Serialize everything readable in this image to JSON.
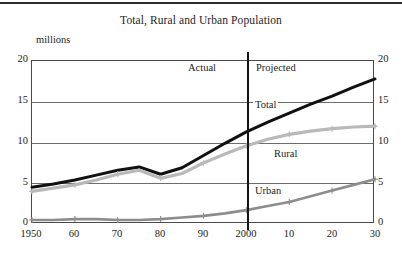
{
  "chart_data": {
    "type": "line",
    "title": "Total, Rural and Urban Population",
    "xlabel": "",
    "ylabel": "millions",
    "ylim": [
      0,
      20
    ],
    "xlim": [
      1950,
      2030
    ],
    "yticks": [
      0,
      5,
      10,
      15,
      20
    ],
    "yticks_right": [
      0,
      5,
      10,
      15,
      20
    ],
    "grid": true,
    "legend": "inline-labels",
    "x": [
      1950,
      1955,
      1960,
      1965,
      1970,
      1975,
      1980,
      1985,
      1990,
      1995,
      2000,
      2005,
      2010,
      2015,
      2020,
      2025,
      2030
    ],
    "xtick_labels": [
      "1950",
      "60",
      "70",
      "80",
      "90",
      "2000",
      "10",
      "20",
      "30"
    ],
    "xtick_values": [
      1950,
      1960,
      1970,
      1980,
      1990,
      2000,
      2010,
      2020,
      2030
    ],
    "series": [
      {
        "name": "Total",
        "color": "#111111",
        "values": [
          4.5,
          4.9,
          5.4,
          6.0,
          6.6,
          7.0,
          6.1,
          6.9,
          8.4,
          9.9,
          11.3,
          12.5,
          13.6,
          14.7,
          15.7,
          16.8,
          17.8
        ]
      },
      {
        "name": "Rural",
        "color": "#b9b9b9",
        "values": [
          4.0,
          4.4,
          4.8,
          5.4,
          6.1,
          6.6,
          5.6,
          6.2,
          7.5,
          8.6,
          9.6,
          10.4,
          11.0,
          11.4,
          11.7,
          11.9,
          12.0
        ]
      },
      {
        "name": "Urban",
        "color": "#8d8d8d",
        "values": [
          0.5,
          0.5,
          0.6,
          0.6,
          0.5,
          0.5,
          0.6,
          0.8,
          1.0,
          1.3,
          1.7,
          2.2,
          2.7,
          3.4,
          4.1,
          4.8,
          5.5
        ]
      }
    ],
    "annotations": [
      {
        "name": "actual",
        "text": "Actual",
        "x": 1985,
        "y": 18.6
      },
      {
        "name": "projected",
        "text": "Projected",
        "x": 2009,
        "y": 18.6
      },
      {
        "name": "divider",
        "text": "",
        "x": 2000,
        "y": null
      }
    ],
    "phase_divider_year": 2000
  },
  "labels": {
    "title": "Total, Rural and Urban Population",
    "unit": "millions",
    "actual": "Actual",
    "projected": "Projected",
    "total": "Total",
    "rural": "Rural",
    "urban": "Urban",
    "y_0": "0",
    "y_5": "5",
    "y_10": "10",
    "y_15": "15",
    "y_20": "20",
    "yr_0": "0",
    "yr_5": "5",
    "yr_10": "10",
    "yr_15": "15",
    "yr_20": "20",
    "x_1950": "1950",
    "x_1960": "60",
    "x_1970": "70",
    "x_1980": "80",
    "x_1990": "90",
    "x_2000": "2000",
    "x_2010": "10",
    "x_2020": "20",
    "x_2030": "30"
  }
}
